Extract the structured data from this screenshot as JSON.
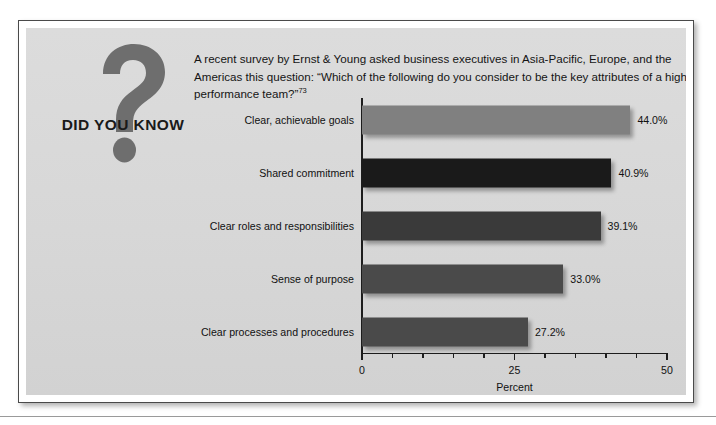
{
  "callout": {
    "badge_label": "DID YOU KNOW",
    "badge_icon": "question-mark-icon",
    "intro_text": "A recent survey by Ernst & Young asked business executives in Asia-Pacific, Europe, and the Americas this question: “Which of the following do you consider to be the key attributes of a high-performance team?”",
    "footnote_marker": "73"
  },
  "colors": {
    "panel_background": "#d9d9d9",
    "page_background": "#ffffff",
    "frame_border": "#4a4a4a",
    "axis": "#1d1d1d",
    "text": "#111111",
    "badge_mark": "#6e6e6e",
    "bar_light": "#808080",
    "bar_black": "#1a1a1a",
    "bar_dark": "#3a3a3a",
    "bar_mid_dark": "#4a4a4a"
  },
  "chart_data": {
    "type": "bar",
    "orientation": "horizontal",
    "title": "",
    "xlabel": "Percent",
    "ylabel": "",
    "xlim": [
      0,
      50
    ],
    "xticks": [
      0,
      25,
      50
    ],
    "xtick_labels": [
      "0",
      "25",
      "50"
    ],
    "minor_tick_step": 5,
    "grid": false,
    "legend": false,
    "categories": [
      "Clear, achievable goals",
      "Shared commitment",
      "Clear roles and responsibilities",
      "Sense of purpose",
      "Clear processes and procedures"
    ],
    "values": [
      44.0,
      40.9,
      39.1,
      33.0,
      27.2
    ],
    "value_labels": [
      "44.0%",
      "40.9%",
      "39.1%",
      "33.0%",
      "27.2%"
    ],
    "bar_colors": [
      "#808080",
      "#1a1a1a",
      "#3a3a3a",
      "#4a4a4a",
      "#4a4a4a"
    ]
  }
}
